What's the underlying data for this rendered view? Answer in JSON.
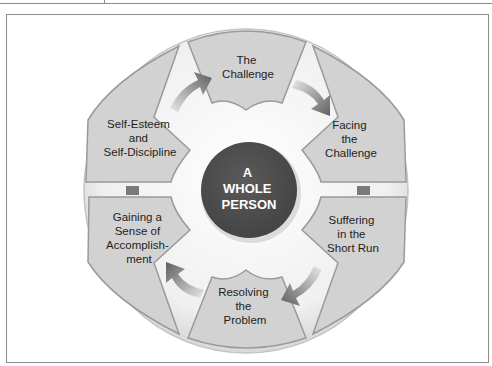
{
  "diagram": {
    "center": {
      "lines": [
        "A",
        "WHOLE",
        "PERSON"
      ],
      "fill": "#505050",
      "text_color": "#ffffff"
    },
    "segments": [
      {
        "id": "the-challenge",
        "lines": [
          "The",
          "Challenge"
        ]
      },
      {
        "id": "facing-the-challenge",
        "lines": [
          "Facing",
          "the",
          "Challenge"
        ]
      },
      {
        "id": "suffering-short-run",
        "lines": [
          "Suffering",
          "in the",
          "Short Run"
        ]
      },
      {
        "id": "resolving-the-problem",
        "lines": [
          "Resolving",
          "the",
          "Problem"
        ]
      },
      {
        "id": "gaining-sense-accomplishment",
        "lines": [
          "Gaining a",
          "Sense of",
          "Accomplish-",
          "ment"
        ]
      },
      {
        "id": "self-esteem-discipline",
        "lines": [
          "Self-Esteem",
          "and",
          "Self-Discipline"
        ]
      }
    ],
    "colors": {
      "segment_fill": "#d2d2d2",
      "segment_stroke": "#9a9a9a",
      "ring_fill": "#eeeeee",
      "arrow": "#6e6e6e",
      "connector": "#7a7a7a"
    }
  }
}
